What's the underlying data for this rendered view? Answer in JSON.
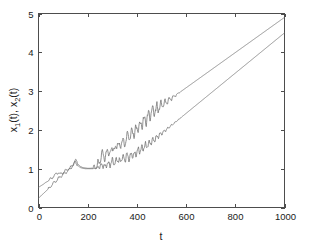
{
  "figure": {
    "background_color": "#ffffff",
    "axes_color": "#4d4d4d",
    "text_color": "#1a1a1a"
  },
  "axis_labels": {
    "x_label": "t",
    "y_label_part1": "x",
    "y_label_sub1": "1",
    "y_label_part2": "(t), x",
    "y_label_sub2": "2",
    "y_label_part3": "(t)",
    "y_label_full": "x1(t), x2(t)"
  },
  "ticks": {
    "x": [
      "0",
      "200",
      "400",
      "600",
      "800",
      "1000"
    ],
    "y": [
      "0",
      "1",
      "2",
      "3",
      "4",
      "5"
    ]
  },
  "chart_data": {
    "type": "line",
    "title": "",
    "subtitle": "",
    "xlabel": "t",
    "ylabel": "x1(t), x2(t)",
    "xlim": [
      0,
      1000
    ],
    "ylim": [
      0,
      5
    ],
    "xticks": [
      0,
      200,
      400,
      600,
      800,
      1000
    ],
    "yticks": [
      0,
      1,
      2,
      3,
      4,
      5
    ],
    "grid": false,
    "legend": null,
    "legend_position": "none",
    "annotations": [],
    "series": [
      {
        "name": "x1(t)",
        "color": "#6e6e6e",
        "linewidth": 0.75,
        "x": [
          0,
          10,
          20,
          30,
          40,
          50,
          60,
          70,
          80,
          90,
          100,
          110,
          120,
          130,
          140,
          150,
          155,
          160,
          170,
          180,
          190,
          200,
          210,
          220,
          230,
          240,
          250,
          255,
          260,
          265,
          270,
          275,
          280,
          285,
          290,
          295,
          300,
          305,
          310,
          315,
          320,
          325,
          330,
          335,
          340,
          345,
          350,
          355,
          360,
          365,
          370,
          375,
          380,
          385,
          390,
          395,
          400,
          405,
          410,
          415,
          420,
          425,
          430,
          435,
          440,
          450,
          460,
          470,
          480,
          500,
          520,
          550,
          600,
          650,
          700,
          750,
          800,
          850,
          900,
          950,
          1000
        ],
        "y": [
          0.52,
          0.56,
          0.6,
          0.65,
          0.68,
          0.74,
          0.8,
          0.86,
          0.9,
          0.86,
          0.9,
          0.95,
          0.99,
          1.03,
          1.1,
          1.22,
          1.18,
          1.12,
          1.06,
          1.03,
          1.02,
          1.01,
          1.01,
          1.02,
          1.05,
          1.1,
          1.2,
          1.32,
          1.42,
          1.35,
          1.26,
          1.36,
          1.5,
          1.44,
          1.36,
          1.45,
          1.58,
          1.52,
          1.46,
          1.56,
          1.68,
          1.6,
          1.54,
          1.64,
          1.74,
          1.68,
          1.62,
          1.72,
          1.84,
          1.88,
          1.8,
          1.86,
          1.98,
          1.94,
          1.9,
          1.98,
          2.06,
          2.08,
          2.06,
          2.12,
          2.18,
          2.2,
          2.22,
          2.25,
          2.3,
          2.38,
          2.45,
          2.52,
          2.6,
          2.78,
          2.95,
          3.2,
          3.6,
          4.0,
          4.4,
          4.8,
          5.2,
          5.6,
          6.0,
          6.4,
          6.8
        ],
        "note": "upper curve; oscillatory from t~240 to t~450 then linear growth reaching ~4.9 at t=1000"
      },
      {
        "name": "x2(t)",
        "color": "#6e6e6e",
        "linewidth": 0.75,
        "x": [
          0,
          10,
          20,
          30,
          40,
          50,
          60,
          70,
          80,
          90,
          100,
          110,
          120,
          130,
          140,
          150,
          160,
          170,
          180,
          190,
          200,
          210,
          220,
          230,
          240,
          250,
          260,
          270,
          280,
          290,
          300,
          310,
          320,
          330,
          340,
          350,
          360,
          370,
          380,
          390,
          400,
          410,
          420,
          430,
          440,
          450,
          460,
          480,
          500,
          550,
          600,
          650,
          700,
          750,
          800,
          850,
          900,
          950,
          1000
        ],
        "y": [
          0.24,
          0.3,
          0.36,
          0.42,
          0.48,
          0.55,
          0.62,
          0.68,
          0.74,
          0.8,
          0.86,
          0.9,
          0.95,
          1.0,
          1.08,
          1.18,
          1.08,
          1.03,
          1.01,
          1.0,
          1.0,
          1.0,
          1.0,
          1.01,
          1.03,
          1.06,
          1.1,
          1.05,
          1.14,
          1.1,
          1.2,
          1.14,
          1.26,
          1.18,
          1.3,
          1.24,
          1.34,
          1.26,
          1.38,
          1.34,
          1.44,
          1.48,
          1.52,
          1.56,
          1.6,
          1.64,
          1.7,
          1.8,
          1.9,
          2.12,
          2.38,
          2.62,
          2.9,
          3.16,
          3.44,
          3.7,
          3.98,
          4.24,
          4.5
        ],
        "note": "lower curve; starts near 0.25, oscillatory mid-range, linear growth reaching ~4.5 at t=1000"
      }
    ]
  }
}
